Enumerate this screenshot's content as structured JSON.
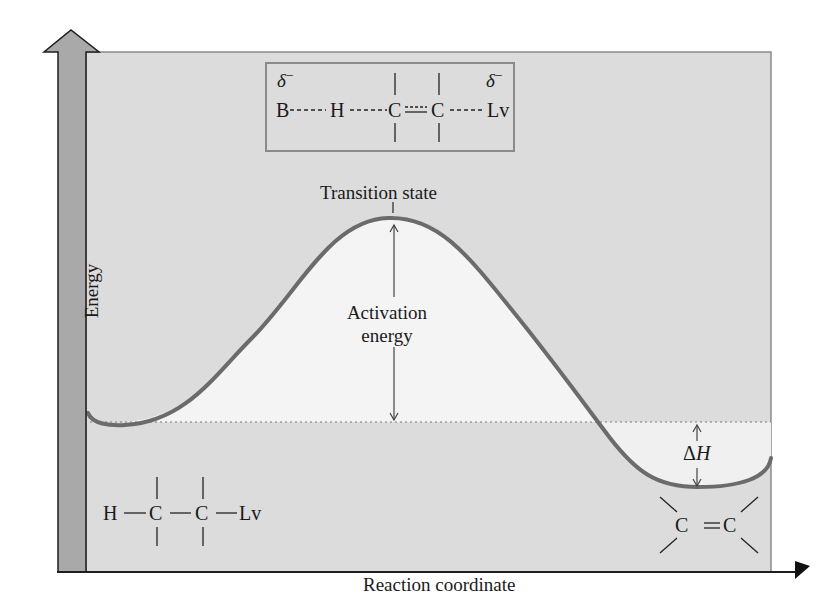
{
  "diagram": {
    "type": "reaction-energy-profile",
    "axes": {
      "y_label": "Energy",
      "x_label": "Reaction coordinate"
    },
    "labels": {
      "transition_state": "Transition state",
      "activation_energy_line1": "Activation",
      "activation_energy_line2": "energy",
      "delta_h_symbol": "Δ",
      "delta_h_var": "H"
    },
    "transition_state_structure": {
      "atoms": [
        "B",
        "H",
        "C",
        "C",
        "Lv"
      ],
      "partial_charge_left": "δ",
      "partial_charge_right": "δ",
      "charge_sign": "−"
    },
    "reactant_structure": {
      "atoms": [
        "H",
        "C",
        "C",
        "Lv"
      ]
    },
    "product_structure": {
      "atoms": [
        "C",
        "C"
      ],
      "bond": "double"
    },
    "colors": {
      "panel_bg": "#dcdcdc",
      "below_curve_fill": "#f2f2f2",
      "axis_bar": "#a9a9a9",
      "curve": "#6b6b6b",
      "outline": "#1e1e1e"
    }
  }
}
